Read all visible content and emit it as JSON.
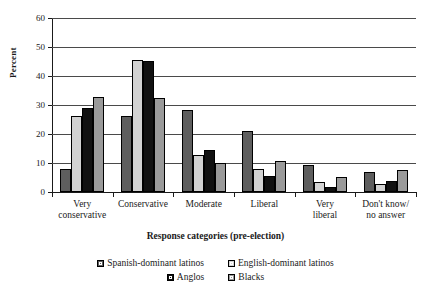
{
  "chart_data": {
    "type": "bar",
    "title": "",
    "xlabel": "Response categories (pre-election)",
    "ylabel": "Percent",
    "ylim": [
      0,
      60
    ],
    "yticks": [
      0,
      10,
      20,
      30,
      40,
      50,
      60
    ],
    "grid": true,
    "legend_position": "bottom",
    "categories": [
      "Very conservative",
      "Conservative",
      "Moderate",
      "Liberal",
      "Very liberal",
      "Don't know/ no answer"
    ],
    "category_lines": [
      [
        "Very",
        "conservative"
      ],
      [
        "Conservative",
        ""
      ],
      [
        "Moderate",
        ""
      ],
      [
        "Liberal",
        ""
      ],
      [
        "Very",
        "liberal"
      ],
      [
        "Don't know/",
        "no answer"
      ]
    ],
    "series": [
      {
        "name": "Spanish-dominant latinos",
        "color": "#5e5e5e",
        "swatch": "sw-spanish",
        "values": [
          8,
          26.3,
          28.2,
          21,
          9.4,
          6.8
        ]
      },
      {
        "name": "English-dominant latinos",
        "color": "#d2d2d2",
        "swatch": "sw-english",
        "values": [
          26.2,
          45.6,
          12.8,
          8,
          3.5,
          2.6
        ]
      },
      {
        "name": "Anglos",
        "color": "#111111",
        "swatch": "sw-anglos",
        "values": [
          28.9,
          45.3,
          14.5,
          5.4,
          1.7,
          3.7
        ]
      },
      {
        "name": "Blacks",
        "color": "#9a9a9a",
        "swatch": "sw-blacks",
        "values": [
          32.7,
          32.5,
          10,
          10.8,
          5.1,
          7.7
        ]
      }
    ]
  }
}
